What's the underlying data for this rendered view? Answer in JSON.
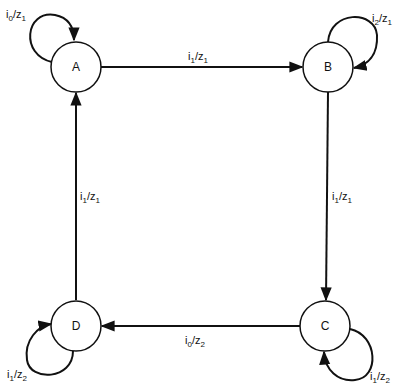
{
  "diagram": {
    "type": "state-machine",
    "states": [
      {
        "id": "A",
        "label": "A",
        "cx": 76,
        "cy": 67
      },
      {
        "id": "B",
        "label": "B",
        "cx": 328,
        "cy": 67
      },
      {
        "id": "C",
        "label": "C",
        "cx": 325,
        "cy": 326
      },
      {
        "id": "D",
        "label": "D",
        "cx": 76,
        "cy": 326
      }
    ],
    "transitions": [
      {
        "from": "A",
        "to": "B",
        "input": "i",
        "input_sub": "1",
        "output": "z",
        "output_sub": "1"
      },
      {
        "from": "B",
        "to": "C",
        "input": "i",
        "input_sub": "1",
        "output": "z",
        "output_sub": "1"
      },
      {
        "from": "C",
        "to": "D",
        "input": "i",
        "input_sub": "0",
        "output": "z",
        "output_sub": "2"
      },
      {
        "from": "D",
        "to": "A",
        "input": "i",
        "input_sub": "1",
        "output": "z",
        "output_sub": "1"
      },
      {
        "from": "A",
        "to": "A",
        "input": "i",
        "input_sub": "0",
        "output": "z",
        "output_sub": "1"
      },
      {
        "from": "B",
        "to": "B",
        "input": "i",
        "input_sub": "2",
        "output": "z",
        "output_sub": "1"
      },
      {
        "from": "C",
        "to": "C",
        "input": "i",
        "input_sub": "1",
        "output": "z",
        "output_sub": "2"
      },
      {
        "from": "D",
        "to": "D",
        "input": "i",
        "input_sub": "1",
        "output": "z",
        "output_sub": "2"
      }
    ]
  },
  "labels": {
    "state_a": "A",
    "state_b": "B",
    "state_c": "C",
    "state_d": "D",
    "ab": {
      "i": "i",
      "is": "1",
      "z": "/z",
      "zs": "1"
    },
    "bc": {
      "i": "i",
      "is": "1",
      "z": "/z",
      "zs": "1"
    },
    "cd": {
      "i": "i",
      "is": "0",
      "z": "/z",
      "zs": "2"
    },
    "da": {
      "i": "i",
      "is": "1",
      "z": "/z",
      "zs": "1"
    },
    "aa": {
      "i": "i",
      "is": "0",
      "z": "/z",
      "zs": "1"
    },
    "bb": {
      "i": "i",
      "is": "2",
      "z": "/z",
      "zs": "1"
    },
    "cc": {
      "i": "i",
      "is": "1",
      "z": "/z",
      "zs": "2"
    },
    "dd": {
      "i": "i",
      "is": "1",
      "z": "/z",
      "zs": "2"
    }
  }
}
